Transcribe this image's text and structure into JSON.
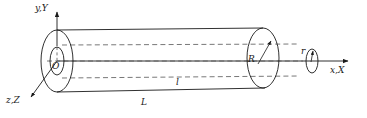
{
  "figure": {
    "type": "engineering-diagram",
    "background_color": "#ffffff",
    "stroke_color": "#1a1a1a",
    "dash_color": "#555555"
  },
  "axes": {
    "y_axis": {
      "label": "y,Y",
      "direction": "up",
      "x": 57,
      "tip_y": 8,
      "base_y": 46
    },
    "x_axis": {
      "label": "x,X",
      "direction": "right",
      "y": 61,
      "start_x": 57,
      "tip_x": 353
    },
    "z_axis": {
      "label": "z,Z",
      "direction": "down-left",
      "from_x": 57,
      "from_y": 61,
      "tip_x": 27,
      "tip_y": 100
    },
    "origin": {
      "label": "O",
      "x": 57,
      "y": 61
    }
  },
  "labels": {
    "radius_major": "R",
    "radius_minor": "r",
    "length_inner": "l",
    "length_outer": "L"
  },
  "geometry": {
    "cylinder": {
      "left_ellipse": {
        "cx": 57,
        "cy": 61,
        "rx": 16,
        "ry": 31
      },
      "right_ellipse": {
        "cx": 263,
        "cy": 58,
        "rx": 16,
        "ry": 30
      },
      "inner_ellipse": {
        "cx": 57,
        "cy": 61,
        "rx": 7,
        "ry": 14
      },
      "small_ellipse": {
        "cx": 312,
        "cy": 61,
        "rx": 6,
        "ry": 12
      },
      "top_edge": {
        "x1": 57,
        "y1": 30,
        "x2": 263,
        "y2": 28
      },
      "bottom_edge": {
        "x1": 57,
        "y1": 92,
        "x2": 265,
        "y2": 88
      }
    },
    "dashed_lines": [
      {
        "x1": 60,
        "y1": 45,
        "x2": 300,
        "y2": 44
      },
      {
        "x1": 48,
        "y1": 61,
        "x2": 305,
        "y2": 61
      },
      {
        "x1": 60,
        "y1": 78,
        "x2": 300,
        "y2": 76
      }
    ]
  }
}
